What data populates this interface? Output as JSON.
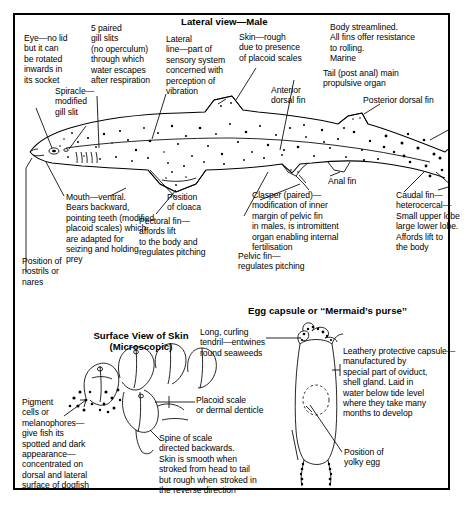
{
  "figure": {
    "title_main": "Lateral view—Male",
    "title_skin": "Surface View of Skin\n(Microscopic)",
    "title_egg": "Egg capsule or ‘‘Mermaid’s purse’’",
    "border_color": "#000000",
    "background_color": "#ffffff",
    "ink_color": "#000000"
  },
  "labels": {
    "eye": "Eye—no lid\nbut it can\nbe rotated\ninwards in\nits socket",
    "gill_slits": "5 paired\ngill slits\n(no operculum)\nthrough which\nwater escapes\nafter respiration",
    "spiracle": "Spiracle—\nmodified\ngill slit",
    "lateral_line": "Lateral\nline—part of\nsensory system\nconcerned with\nperception of\nvibration",
    "skin": "Skin—rough\ndue to presence\nof placoid scales",
    "body_streamlined": "Body streamlined.\nAll fins offer resistance\nto rolling.\nMarine",
    "anterior_dorsal_fin": "Anterior\ndorsal fin",
    "tail": "Tail (post anal) main\npropulsive organ",
    "posterior_dorsal_fin": "Posterior dorsal fin",
    "mouth": "Mouth—ventral.\nBears backward,\npointing teeth (modified\nplacoid scales) which\nare adapted for\nseizing and holding\nprey",
    "nostrils": "Position of\nnostrils or\nnares",
    "cloaca": "Position\nof cloaca",
    "pectoral_fin": "Pectoral fin—\naffords lift\nto the body and\nregulates pitching",
    "anal_fin": "Anal fin",
    "clasper": "Clasper (paired)—\nmodification of inner\nmargin of pelvic fin\nin males, is intromittent\norgan enabling internal\nfertilisation",
    "pelvic_fin": "Pelvic fin—\nregulates pitching",
    "caudal_fin": "Caudal fin—\nheterocercal—\nSmall upper lobe\nlarge lower lobe.\nAffords lift to\nthe body",
    "pigment_cells": "Pigment\ncells or\nmelanophores—\ngive fish its\nspotted and dark\nappearance—\nconcentrated on\ndorsal and lateral\nsurface of dogfish",
    "placoid_scale": "Placoid scale\nor dermal denticle",
    "spine_of_scale": "Spine of scale\ndirected backwards.\nSkin is smooth when\nstroked from head to tail\nbut rough when stroked in\nthe reverse direction",
    "tendril": "Long, curling\ntendril—entwines\nround seaweeds",
    "leathery_capsule": "Leathery protective capsule—\nmanufactured by\nspecial part of oviduct,\nshell gland. Laid in\nwater below tide level\nwhere they take many\nmonths to develop",
    "yolky_egg": "Position of\nyolky egg"
  }
}
